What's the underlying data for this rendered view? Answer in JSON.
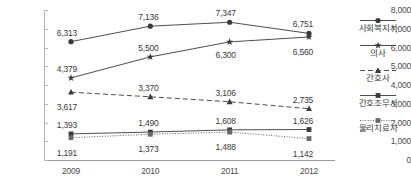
{
  "chart_data": {
    "type": "line",
    "title": "",
    "xlabel": "",
    "ylabel": "",
    "categories": [
      "2009",
      "2010",
      "2011",
      "2012"
    ],
    "ylim": [
      0,
      8000
    ],
    "ytick_labels": [
      "0",
      "1,000",
      "2,000",
      "3,000",
      "4,000",
      "5,000",
      "6,000",
      "7,000",
      "8,000"
    ],
    "ytick_values": [
      0,
      1000,
      2000,
      3000,
      4000,
      5000,
      6000,
      7000,
      8000
    ],
    "grid": false,
    "legend_position": "right",
    "series": [
      {
        "name": "사회복지사",
        "marker": "circle",
        "line_style": "solid",
        "color": "#3a3a3a",
        "values": [
          6313,
          7136,
          7347,
          6751
        ],
        "labels": [
          "6,313",
          "7,136",
          "7,347",
          "6,751"
        ]
      },
      {
        "name": "의사",
        "marker": "star",
        "line_style": "solid",
        "color": "#3a3a3a",
        "values": [
          4379,
          5500,
          6300,
          6560
        ],
        "labels": [
          "4,379",
          "5,500",
          "6,300",
          "6,560"
        ]
      },
      {
        "name": "간호사",
        "marker": "triangle",
        "line_style": "dashed",
        "color": "#3a3a3a",
        "values": [
          3617,
          3370,
          3106,
          2735
        ],
        "labels": [
          "3,617",
          "3,370",
          "3,106",
          "2,735"
        ]
      },
      {
        "name": "간호조무사",
        "marker": "square",
        "line_style": "solid",
        "color": "#3a3a3a",
        "values": [
          1393,
          1490,
          1608,
          1626
        ],
        "labels": [
          "1,393",
          "1,490",
          "1,608",
          "1,626"
        ]
      },
      {
        "name": "물리치료사",
        "marker": "square",
        "line_style": "dotted",
        "color": "#6a6a6a",
        "values": [
          1191,
          1373,
          1488,
          1142
        ],
        "labels": [
          "1,191",
          "1,373",
          "1,488",
          "1,142"
        ]
      }
    ]
  }
}
